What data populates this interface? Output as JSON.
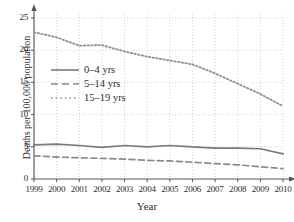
{
  "chart_data": {
    "type": "line",
    "title": "",
    "xlabel": "Year",
    "ylabel": "Deaths per 100,000 population",
    "x": [
      1999,
      2000,
      2001,
      2002,
      2003,
      2004,
      2005,
      2006,
      2007,
      2008,
      2009,
      2010
    ],
    "xticklabels": [
      "1999",
      "2000",
      "2001",
      "2002",
      "2003",
      "2004",
      "2005",
      "2006",
      "2007",
      "2008",
      "2009",
      "2010"
    ],
    "yticklabels": [
      "0",
      "5",
      "10",
      "15",
      "20",
      "25"
    ],
    "yticks": [
      0,
      5,
      10,
      15,
      20,
      25
    ],
    "xlim": [
      1999,
      2010
    ],
    "ylim": [
      0,
      25
    ],
    "grid": true,
    "legend_position": "upper left",
    "series": [
      {
        "name": "0–4 yrs",
        "style": "solid",
        "color": "#7a7a7a",
        "values": [
          5.3,
          5.4,
          5.2,
          4.9,
          5.2,
          5.0,
          5.2,
          5.0,
          4.8,
          4.8,
          4.7,
          3.9
        ]
      },
      {
        "name": "5–14 yrs",
        "style": "dashed",
        "color": "#8a8a8a",
        "values": [
          3.6,
          3.4,
          3.3,
          3.2,
          3.1,
          2.9,
          2.8,
          2.6,
          2.4,
          2.2,
          1.9,
          1.6
        ]
      },
      {
        "name": "15–19 yrs",
        "style": "dotted",
        "color": "#8f8f8f",
        "values": [
          22.8,
          22.0,
          20.7,
          20.8,
          19.8,
          19.0,
          18.4,
          17.8,
          16.4,
          14.8,
          13.2,
          11.3
        ]
      }
    ]
  },
  "axis": {
    "x_label": "Year",
    "y_label": "Deaths per 100,000 population"
  },
  "legend": {
    "items": [
      {
        "label": "0–4 yrs"
      },
      {
        "label": "5–14 yrs"
      },
      {
        "label": "15–19 yrs"
      }
    ]
  },
  "colors": {
    "series_a": "#7a7a7a",
    "series_b": "#8a8a8a",
    "series_c": "#8f8f8f",
    "grid": "#bdbdbd",
    "axis": "#555555",
    "text": "#2b2b2b"
  }
}
